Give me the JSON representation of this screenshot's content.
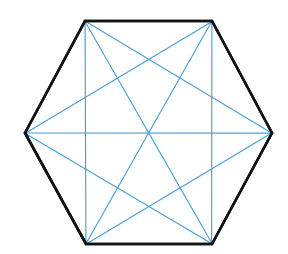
{
  "figure": {
    "canvas": {
      "width": 288,
      "height": 254,
      "background": "#ffffff"
    },
    "shape_name": "hexagon",
    "vertex_count": 6,
    "diagonal_count": 9,
    "side_count": 6
  },
  "colors": {
    "outline": "#121212",
    "diagonal": "#4a9ed6",
    "background": "#ffffff"
  },
  "strokes": {
    "outline_width": 2.6,
    "diagonal_width": 1.15
  },
  "vertices": [
    {
      "id": "A",
      "label": "top-left",
      "x": 85,
      "y": 21
    },
    {
      "id": "B",
      "label": "top-right",
      "x": 212,
      "y": 21
    },
    {
      "id": "C",
      "label": "right",
      "x": 272,
      "y": 133
    },
    {
      "id": "D",
      "label": "bottom-right",
      "x": 212,
      "y": 244
    },
    {
      "id": "E",
      "label": "bottom-left",
      "x": 86,
      "y": 244
    },
    {
      "id": "F",
      "label": "left",
      "x": 25,
      "y": 133
    }
  ],
  "sides": [
    {
      "id": "AB",
      "from": "A",
      "to": "B",
      "x1": 85,
      "y1": 21,
      "x2": 212,
      "y2": 21
    },
    {
      "id": "BC",
      "from": "B",
      "to": "C",
      "x1": 212,
      "y1": 21,
      "x2": 272,
      "y2": 133
    },
    {
      "id": "CD",
      "from": "C",
      "to": "D",
      "x1": 272,
      "y1": 133,
      "x2": 212,
      "y2": 244
    },
    {
      "id": "DE",
      "from": "D",
      "to": "E",
      "x1": 212,
      "y1": 244,
      "x2": 86,
      "y2": 244
    },
    {
      "id": "EF",
      "from": "E",
      "to": "F",
      "x1": 86,
      "y1": 244,
      "x2": 25,
      "y2": 133
    },
    {
      "id": "FA",
      "from": "F",
      "to": "A",
      "x1": 25,
      "y1": 133,
      "x2": 85,
      "y2": 21
    }
  ],
  "diagonals": [
    {
      "id": "AC",
      "from": "A",
      "to": "C",
      "x1": 85,
      "y1": 21,
      "x2": 272,
      "y2": 133,
      "kind": "short"
    },
    {
      "id": "AD",
      "from": "A",
      "to": "D",
      "x1": 85,
      "y1": 21,
      "x2": 212,
      "y2": 244,
      "kind": "long"
    },
    {
      "id": "AE",
      "from": "A",
      "to": "E",
      "x1": 85,
      "y1": 21,
      "x2": 86,
      "y2": 244,
      "kind": "short"
    },
    {
      "id": "BD",
      "from": "B",
      "to": "D",
      "x1": 212,
      "y1": 21,
      "x2": 212,
      "y2": 244,
      "kind": "short"
    },
    {
      "id": "BE",
      "from": "B",
      "to": "E",
      "x1": 212,
      "y1": 21,
      "x2": 86,
      "y2": 244,
      "kind": "long"
    },
    {
      "id": "BF",
      "from": "B",
      "to": "F",
      "x1": 212,
      "y1": 21,
      "x2": 25,
      "y2": 133,
      "kind": "short"
    },
    {
      "id": "CE",
      "from": "C",
      "to": "E",
      "x1": 272,
      "y1": 133,
      "x2": 86,
      "y2": 244,
      "kind": "short"
    },
    {
      "id": "CF",
      "from": "C",
      "to": "F",
      "x1": 272,
      "y1": 133,
      "x2": 25,
      "y2": 133,
      "kind": "long"
    },
    {
      "id": "DF",
      "from": "D",
      "to": "F",
      "x1": 212,
      "y1": 244,
      "x2": 25,
      "y2": 133,
      "kind": "short"
    }
  ]
}
